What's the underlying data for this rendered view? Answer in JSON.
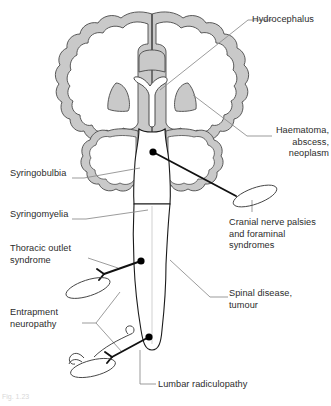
{
  "figure": {
    "caption": "Fig. 1.23",
    "background_color": "#ffffff",
    "palette": {
      "outline": "#1a1a1a",
      "grey_matter_fill": "#c9c9c9",
      "grey_matter_stroke": "#6f6f6f",
      "white_fill": "#ffffff",
      "leader_line": "#8a8a8a",
      "nerve_line": "#111111",
      "marker_dot": "#000000",
      "label_text": "#2b2b2b",
      "caption_text": "#d8d8d8"
    }
  },
  "labels": [
    {
      "id": "hydrocephalus",
      "text": "Hydrocephalus",
      "align": "left",
      "x": 252,
      "y": 14,
      "width": 78,
      "leader": "from ventricle (Y-shaped cavity) to right"
    },
    {
      "id": "haematoma",
      "text": "Haematoma,\nabscess,\nneoplasm",
      "align": "right",
      "x": 261,
      "y": 125,
      "width": 68,
      "leader": "from right basal ganglia / hemisphere to right"
    },
    {
      "id": "syringobulbia",
      "text": "Syringobulbia",
      "align": "left",
      "x": 10,
      "y": 168,
      "width": 70,
      "leader": "from left cerebellar hemisphere to left"
    },
    {
      "id": "syringomyelia",
      "text": "Syringomyelia",
      "align": "left",
      "x": 10,
      "y": 209,
      "width": 70,
      "leader": "from upper spinal cord to left"
    },
    {
      "id": "cranial-nerve-palsies",
      "text": "Cranial nerve palsies\nand foraminal\nsyndromes",
      "align": "left",
      "x": 229,
      "y": 217,
      "width": 100,
      "leader": "from nerve ellipse below right cerebellum"
    },
    {
      "id": "thoracic-outlet-syndrome",
      "text": "Thoracic outlet\nsyndrome",
      "align": "left",
      "x": 10,
      "y": 243,
      "width": 78,
      "leader": "to upper nerve branch point"
    },
    {
      "id": "spinal-disease-tumour",
      "text": "Spinal disease,\ntumour",
      "align": "left",
      "x": 229,
      "y": 288,
      "width": 86,
      "leader": "from mid spinal cord to right"
    },
    {
      "id": "entrapment-neuropathy",
      "text": "Entrapment\nneuropathy",
      "align": "left",
      "x": 10,
      "y": 307,
      "width": 72,
      "leader": "forked leader to upper and lower nerve ellipses"
    },
    {
      "id": "lumbar-radiculopathy",
      "text": "Lumbar radiculopathy",
      "align": "left",
      "x": 158,
      "y": 379,
      "width": 112,
      "leader": "from lower spinal cord down then right"
    }
  ],
  "anatomy": {
    "parts": [
      {
        "id": "cerebral-cortex",
        "name": "cerebral cortex ribbon",
        "fill": "#c9c9c9"
      },
      {
        "id": "left-hemisphere",
        "name": "left cerebral hemisphere",
        "fill": "#ffffff"
      },
      {
        "id": "right-hemisphere",
        "name": "right cerebral hemisphere",
        "fill": "#ffffff"
      },
      {
        "id": "lateral-ventricles",
        "name": "Y-shaped ventricular system",
        "fill": "#ffffff"
      },
      {
        "id": "corpus-callosum",
        "name": "corpus callosum",
        "fill": "#c9c9c9"
      },
      {
        "id": "left-basal-ganglia",
        "name": "left basal ganglion",
        "fill": "#c9c9c9"
      },
      {
        "id": "right-basal-ganglia",
        "name": "right basal ganglion",
        "fill": "#c9c9c9"
      },
      {
        "id": "left-cerebellum",
        "name": "left cerebellar hemisphere",
        "fill": "#ffffff"
      },
      {
        "id": "right-cerebellum",
        "name": "right cerebellar hemisphere",
        "fill": "#ffffff"
      },
      {
        "id": "brainstem",
        "name": "brainstem",
        "fill": "#ffffff"
      },
      {
        "id": "spinal-cord",
        "name": "spinal cord",
        "fill": "#ffffff"
      }
    ],
    "lesion_markers": [
      {
        "id": "marker-intracranial",
        "x": 153,
        "y": 152,
        "radius": 3.6
      },
      {
        "id": "marker-cervical",
        "x": 141,
        "y": 261,
        "radius": 3.6
      },
      {
        "id": "marker-lumbar",
        "x": 149,
        "y": 337,
        "radius": 3.6
      }
    ],
    "nerve_branches": [
      {
        "id": "cranial-nerve-branch",
        "description": "nerve from intracranial marker to right ellipse"
      },
      {
        "id": "brachial-plexus-branch",
        "description": "nerve from cervical marker to left upper ellipse"
      },
      {
        "id": "lumbosacral-plexus-branch",
        "description": "nerve from lumbar marker to left lower ellipse"
      }
    ]
  }
}
